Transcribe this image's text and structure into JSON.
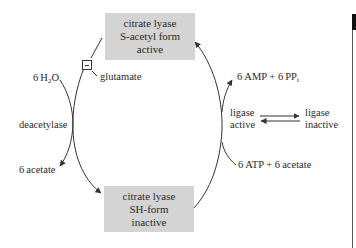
{
  "diagram": {
    "nodes": {
      "top_box": {
        "line1": "citrate lyase",
        "line2": "S-acetyl form",
        "line3": "active",
        "color": "#d4d4d4"
      },
      "bottom_box": {
        "line1": "citrate lyase",
        "line2": "SH-form",
        "line3": "inactive",
        "color": "#d4d4d4"
      }
    },
    "left_branch": {
      "water": {
        "prefix": "6 H",
        "sub": "2",
        "suffix": "O"
      },
      "enzyme": "deacetylase",
      "product": "6 acetate",
      "inhibitor_symbol": "−",
      "inhibitor": "glutamate"
    },
    "right_branch": {
      "products": {
        "text": "6 AMP + 6 PP",
        "sub": "i"
      },
      "enzyme_active_line1": "ligase",
      "enzyme_active_line2": "active",
      "enzyme_inactive_line1": "ligase",
      "enzyme_inactive_line2": "inactive",
      "substrates": "6 ATP + 6 acetate"
    }
  }
}
